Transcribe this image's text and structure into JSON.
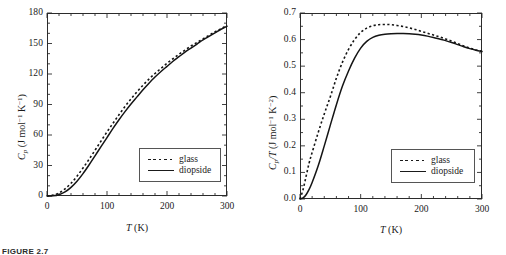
{
  "figure": {
    "caption": "FIGURE 2.7",
    "panel_count": 2
  },
  "panels": [
    {
      "id": "left",
      "ylabel_main": "C",
      "ylabel_sub": "p",
      "ylabel_units": " (J mol",
      "ylabel_sup1": "−1",
      "ylabel_mid": " K",
      "ylabel_sup2": "−1",
      "ylabel_end": ")",
      "xlabel_main": "T",
      "xlabel_units": " (K)",
      "legend": [
        {
          "key": "dotted",
          "label": "glass"
        },
        {
          "key": "solid",
          "label": "diopside"
        }
      ],
      "yticks": [
        "0",
        "30",
        "60",
        "90",
        "120",
        "150",
        "180"
      ],
      "xticks": [
        "0",
        "100",
        "200",
        "300"
      ]
    },
    {
      "id": "right",
      "ylabel_main": "C",
      "ylabel_sub": "p",
      "ylabel_slash": "/T",
      "ylabel_units": " (J mol",
      "ylabel_sup1": "−1",
      "ylabel_mid": " K",
      "ylabel_sup2": "−2",
      "ylabel_end": ")",
      "xlabel_main": "T",
      "xlabel_units": " (K)",
      "legend": [
        {
          "key": "dotted",
          "label": "glass"
        },
        {
          "key": "solid",
          "label": "diopside"
        }
      ],
      "yticks": [
        "0.0",
        "0.1",
        "0.2",
        "0.3",
        "0.4",
        "0.5",
        "0.6",
        "0.7"
      ],
      "xticks": [
        "0",
        "100",
        "200",
        "300"
      ]
    }
  ],
  "chart_data": [
    {
      "type": "line",
      "title": "",
      "xlabel": "T (K)",
      "ylabel": "Cp (J mol-1 K-1)",
      "xlim": [
        0,
        300
      ],
      "ylim": [
        0,
        180
      ],
      "xticks": [
        0,
        100,
        200,
        300
      ],
      "yticks": [
        0,
        30,
        60,
        90,
        120,
        150,
        180
      ],
      "xminor_step": 20,
      "yminor_step": 10,
      "grid": false,
      "legend_position": "lower-right",
      "series": [
        {
          "name": "glass",
          "style": "dotted",
          "x": [
            0,
            10,
            20,
            30,
            40,
            50,
            60,
            70,
            80,
            90,
            100,
            110,
            120,
            130,
            140,
            150,
            160,
            170,
            180,
            190,
            200,
            210,
            220,
            230,
            240,
            250,
            260,
            270,
            280,
            290,
            300
          ],
          "y": [
            0.0,
            0.9,
            3.0,
            7.0,
            12.5,
            19.5,
            27.5,
            36.0,
            45.0,
            54.0,
            63.0,
            71.5,
            80.0,
            88.0,
            95.5,
            102.5,
            109.0,
            115.0,
            120.5,
            125.5,
            130.5,
            135.0,
            139.5,
            143.5,
            147.5,
            151.0,
            154.5,
            158.0,
            161.5,
            164.5,
            168.0
          ]
        },
        {
          "name": "diopside",
          "style": "solid",
          "x": [
            0,
            10,
            20,
            30,
            40,
            50,
            60,
            70,
            80,
            90,
            100,
            110,
            120,
            130,
            140,
            150,
            160,
            170,
            180,
            190,
            200,
            210,
            220,
            230,
            240,
            250,
            260,
            270,
            280,
            290,
            300
          ],
          "y": [
            0.0,
            0.2,
            1.3,
            4.0,
            8.5,
            14.5,
            22.0,
            30.5,
            39.5,
            48.5,
            57.5,
            66.5,
            75.0,
            83.0,
            90.5,
            97.5,
            104.5,
            111.0,
            117.0,
            122.5,
            127.5,
            132.5,
            137.0,
            141.5,
            145.5,
            149.5,
            153.5,
            157.0,
            160.5,
            164.0,
            167.0
          ]
        }
      ]
    },
    {
      "type": "line",
      "title": "",
      "xlabel": "T (K)",
      "ylabel": "Cp/T (J mol-1 K-2)",
      "xlim": [
        0,
        300
      ],
      "ylim": [
        0.0,
        0.7
      ],
      "xticks": [
        0,
        100,
        200,
        300
      ],
      "yticks": [
        0.0,
        0.1,
        0.2,
        0.3,
        0.4,
        0.5,
        0.6,
        0.7
      ],
      "xminor_step": 20,
      "yminor_step": 0.05,
      "grid": false,
      "legend_position": "lower-right",
      "series": [
        {
          "name": "glass",
          "style": "dotted",
          "x": [
            0,
            5,
            10,
            15,
            20,
            30,
            40,
            50,
            60,
            70,
            80,
            90,
            100,
            110,
            120,
            130,
            140,
            150,
            160,
            170,
            180,
            190,
            200,
            210,
            220,
            230,
            240,
            250,
            260,
            270,
            280,
            290,
            300
          ],
          "y": [
            0.0,
            0.035,
            0.085,
            0.135,
            0.175,
            0.25,
            0.32,
            0.385,
            0.455,
            0.515,
            0.563,
            0.6,
            0.627,
            0.643,
            0.652,
            0.656,
            0.657,
            0.656,
            0.653,
            0.649,
            0.644,
            0.638,
            0.631,
            0.624,
            0.617,
            0.61,
            0.602,
            0.594,
            0.585,
            0.576,
            0.568,
            0.561,
            0.556
          ]
        },
        {
          "name": "diopside",
          "style": "solid",
          "x": [
            0,
            5,
            10,
            15,
            20,
            30,
            40,
            50,
            60,
            70,
            80,
            90,
            100,
            110,
            120,
            130,
            140,
            150,
            160,
            170,
            180,
            190,
            200,
            210,
            220,
            230,
            240,
            250,
            260,
            270,
            280,
            290,
            300
          ],
          "y": [
            0.0,
            0.004,
            0.016,
            0.036,
            0.062,
            0.125,
            0.2,
            0.278,
            0.355,
            0.425,
            0.482,
            0.53,
            0.568,
            0.593,
            0.608,
            0.616,
            0.62,
            0.622,
            0.623,
            0.623,
            0.622,
            0.62,
            0.617,
            0.613,
            0.608,
            0.602,
            0.596,
            0.589,
            0.581,
            0.573,
            0.566,
            0.56,
            0.555
          ]
        }
      ]
    }
  ]
}
